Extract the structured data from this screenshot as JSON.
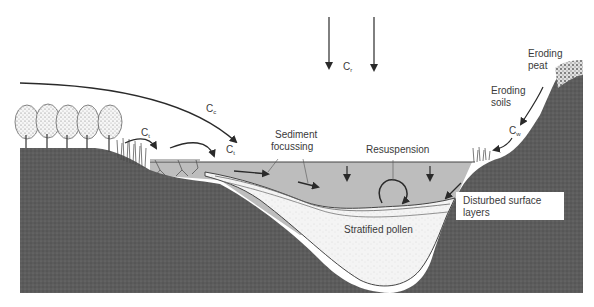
{
  "diagram": {
    "labels": {
      "rain": {
        "main": "C",
        "sub": "r"
      },
      "canopy": {
        "main": "C",
        "sub": "c"
      },
      "trunk_1": {
        "main": "C",
        "sub": "t"
      },
      "trunk_2": {
        "main": "C",
        "sub": "t"
      },
      "water": {
        "main": "C",
        "sub": "w"
      },
      "eroding_peat_line1": "Eroding",
      "eroding_peat_line2": "peat",
      "eroding_soils_line1": "Eroding",
      "eroding_soils_line2": "soils",
      "sediment_focussing_line1": "Sediment",
      "sediment_focussing_line2": "focussing",
      "resuspension": "Resuspension",
      "stratified_pollen": "Stratified pollen",
      "disturbed_line1": "Disturbed surface",
      "disturbed_line2": "layers"
    },
    "colors": {
      "ground": "#5a5a5a",
      "water": "#bdbdbd",
      "sediment": "#f2f2f2",
      "peat": "#d8d8d8",
      "arrow": "#2a2a2a",
      "text": "#3a3a3a",
      "tree": "#eaeaea"
    }
  }
}
